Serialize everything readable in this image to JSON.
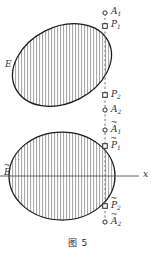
{
  "figure": {
    "caption": "图 5",
    "caption_y": 236
  },
  "shapes": {
    "upper": {
      "name": "tilted-hatched-ellipse",
      "cx": 62,
      "cy": 65,
      "rx": 52,
      "ry": 38,
      "rotation": -27,
      "stroke": "#1a1a1a",
      "hatch_color": "#8e8e8e"
    },
    "lower": {
      "name": "hatched-ellipse",
      "cx": 62,
      "cy": 176,
      "rx": 53,
      "ry": 44,
      "rotation": 0,
      "stroke": "#1a1a1a",
      "hatch_color": "#8e8e8e"
    }
  },
  "vertical_line": {
    "name": "dashed-chord-line",
    "x": 105,
    "y_top": 13,
    "y_bottom": 222,
    "color": "#7a7a7a",
    "style": "dashed"
  },
  "horizontal_axis": {
    "name": "horizontal-axis",
    "y": 176,
    "x_start": 0,
    "x_end": 139,
    "color": "#555555",
    "label": "x"
  },
  "set_labels": [
    {
      "id": "upper-set",
      "text": "E",
      "accent": "",
      "x": 6,
      "y": 64
    },
    {
      "id": "lower-set",
      "text": "E",
      "accent": "~",
      "x": 5,
      "y": 172
    }
  ],
  "points": [
    {
      "id": "A1",
      "base": "A",
      "sub": "1",
      "accent": "",
      "marker": "circle",
      "mx": 105,
      "my": 13,
      "lx": 111,
      "ly": 9
    },
    {
      "id": "P1",
      "base": "P",
      "sub": "1",
      "accent": "",
      "marker": "square",
      "mx": 105,
      "my": 26,
      "lx": 111,
      "ly": 22
    },
    {
      "id": "P2",
      "base": "P",
      "sub": "2",
      "accent": "",
      "marker": "square",
      "mx": 105,
      "my": 95,
      "lx": 111,
      "ly": 92
    },
    {
      "id": "A2",
      "base": "A",
      "sub": "2",
      "accent": "",
      "marker": "circle",
      "mx": 105,
      "my": 110,
      "lx": 111,
      "ly": 107
    },
    {
      "id": "A1t",
      "base": "A",
      "sub": "1",
      "accent": "~",
      "marker": "circle",
      "mx": 105,
      "my": 130,
      "lx": 111,
      "ly": 127
    },
    {
      "id": "P1t",
      "base": "P",
      "sub": "1",
      "accent": "~",
      "marker": "square",
      "mx": 105,
      "my": 146,
      "lx": 111,
      "ly": 143
    },
    {
      "id": "P2t",
      "base": "P",
      "sub": "2",
      "accent": "~",
      "marker": "square",
      "mx": 105,
      "my": 206,
      "lx": 111,
      "ly": 204
    },
    {
      "id": "A2t",
      "base": "A",
      "sub": "2",
      "accent": "~",
      "marker": "circle",
      "mx": 105,
      "my": 222,
      "lx": 111,
      "ly": 219
    }
  ],
  "axis_label_pos": {
    "x": 143,
    "y": 172
  },
  "colors": {
    "outline": "#1a1a1a",
    "hatch": "#8e8e8e",
    "dashed": "#7a7a7a",
    "axis": "#555555",
    "text": "#2b2b2b",
    "background": "#ffffff"
  }
}
